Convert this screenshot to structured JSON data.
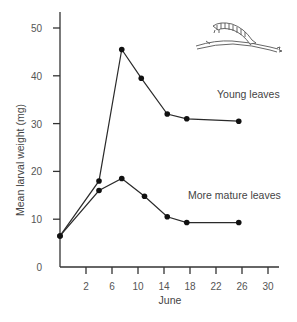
{
  "chart_data": {
    "type": "line",
    "title": "",
    "xlabel": "June",
    "ylabel": "Mean larval weight (mg)",
    "xlim": [
      -2,
      32
    ],
    "ylim": [
      0,
      53
    ],
    "x_ticks": [
      2,
      6,
      10,
      14,
      18,
      22,
      26,
      30
    ],
    "y_ticks": [
      0,
      10,
      20,
      30,
      40,
      50
    ],
    "grid": false,
    "legend": "inline annotations",
    "series": [
      {
        "name": "Young leaves",
        "x": [
          -2,
          4,
          7.5,
          10.5,
          14.5,
          17.5,
          25.5
        ],
        "values": [
          6.5,
          18,
          45.5,
          39.5,
          32,
          31,
          30.5
        ]
      },
      {
        "name": "More mature leaves",
        "x": [
          -2,
          4,
          7.5,
          11,
          14.5,
          17.5,
          25.5
        ],
        "values": [
          6.5,
          16,
          18.5,
          14.8,
          10.5,
          9.3,
          9.3
        ]
      }
    ],
    "annotations": [
      "Young leaves",
      "More mature leaves"
    ],
    "illustration": "caterpillar-on-twig"
  },
  "labels": {
    "ylabel": "Mean larval weight (mg)",
    "xlabel": "June",
    "young": "Young leaves",
    "mature": "More mature leaves"
  }
}
